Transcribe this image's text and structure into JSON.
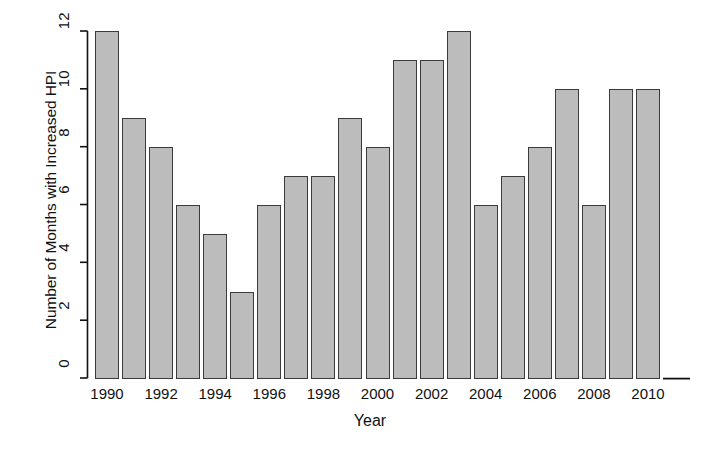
{
  "chart_data": {
    "type": "bar",
    "title": "",
    "xlabel": "Year",
    "ylabel": "Number of Months with Increased HPI",
    "categories": [
      1990,
      1991,
      1992,
      1993,
      1994,
      1995,
      1996,
      1997,
      1998,
      1999,
      2000,
      2001,
      2002,
      2003,
      2004,
      2005,
      2006,
      2007,
      2008,
      2009,
      2010
    ],
    "values": [
      12,
      9,
      8,
      6,
      5,
      3,
      6,
      7,
      7,
      9,
      8,
      11,
      11,
      12,
      6,
      7,
      8,
      10,
      6,
      10,
      10
    ],
    "ylim": [
      0,
      12
    ],
    "xtick_labels": [
      "1990",
      "1992",
      "1994",
      "1996",
      "1998",
      "2000",
      "2002",
      "2004",
      "2006",
      "2008",
      "2010"
    ],
    "ytick_labels": [
      "0",
      "2",
      "4",
      "6",
      "8",
      "10",
      "12"
    ],
    "ytick_values": [
      0,
      2,
      4,
      6,
      8,
      10,
      12
    ],
    "grid": false,
    "legend": null,
    "bar_fill_color": "#bcbcbc",
    "bar_edge_color": "#3b3b3b",
    "axis_color": "#111111",
    "background_color": "#ffffff"
  }
}
